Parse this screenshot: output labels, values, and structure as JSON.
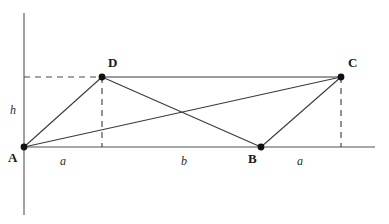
{
  "figure": {
    "type": "geometry-diagram",
    "width": 389,
    "height": 224,
    "background_color": "#ffffff"
  },
  "colors": {
    "axis": "#8a8a8a",
    "segment": "#3a3a3a",
    "dashed": "#4a4a4a",
    "vertex_dot": "#111111",
    "label_text": "#1a1a1a",
    "measure_text": "#2b2b2b"
  },
  "axes": {
    "y_axis": {
      "x": 24,
      "y_top": 13,
      "y_bottom": 215
    },
    "x_axis": {
      "y": 147,
      "x_left": 24,
      "x_right": 375
    }
  },
  "vertices": [
    {
      "id": "A",
      "label": "A",
      "x": 24,
      "y": 147,
      "label_x": 8,
      "label_y": 151
    },
    {
      "id": "B",
      "label": "B",
      "x": 261,
      "y": 147,
      "label_x": 248,
      "label_y": 152
    },
    {
      "id": "C",
      "label": "C",
      "x": 341,
      "y": 77,
      "label_x": 348,
      "label_y": 56
    },
    {
      "id": "D",
      "label": "D",
      "x": 102,
      "y": 77,
      "label_x": 108,
      "label_y": 56
    }
  ],
  "segments": [
    {
      "name": "side-AD",
      "from": "A",
      "to": "D",
      "x1": 24,
      "y1": 147,
      "x2": 102,
      "y2": 77
    },
    {
      "name": "side-DC",
      "from": "D",
      "to": "C",
      "x1": 102,
      "y1": 77,
      "x2": 341,
      "y2": 77
    },
    {
      "name": "side-CB",
      "from": "C",
      "to": "B",
      "x1": 341,
      "y1": 77,
      "x2": 261,
      "y2": 147
    },
    {
      "name": "side-BA",
      "from": "B",
      "to": "A",
      "x1": 261,
      "y1": 147,
      "x2": 24,
      "y2": 147
    },
    {
      "name": "diagonal-AC",
      "from": "A",
      "to": "C",
      "x1": 24,
      "y1": 147,
      "x2": 341,
      "y2": 77
    },
    {
      "name": "diagonal-DB",
      "from": "D",
      "to": "B",
      "x1": 102,
      "y1": 77,
      "x2": 261,
      "y2": 147
    }
  ],
  "dashed_guides": [
    {
      "name": "height-guide-to-D",
      "x1": 24,
      "y1": 77,
      "x2": 102,
      "y2": 77
    },
    {
      "name": "drop-line-from-D",
      "x1": 102,
      "y1": 77,
      "x2": 102,
      "y2": 147
    },
    {
      "name": "drop-line-from-C",
      "x1": 341,
      "y1": 77,
      "x2": 341,
      "y2": 147
    }
  ],
  "measures": [
    {
      "name": "height-h",
      "label": "h",
      "x": 10,
      "y": 104
    },
    {
      "name": "segment-a1",
      "label": "a",
      "x": 60,
      "y": 155
    },
    {
      "name": "segment-b",
      "label": "b",
      "x": 181,
      "y": 155
    },
    {
      "name": "segment-a2",
      "label": "a",
      "x": 297,
      "y": 155
    }
  ]
}
